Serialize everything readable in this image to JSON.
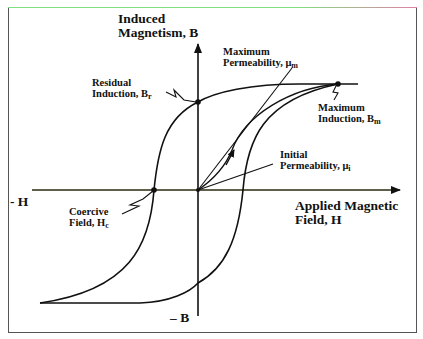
{
  "diagram": {
    "type": "hysteresis-loop",
    "y_axis": {
      "label_line1": "Induced",
      "label_line2": "Magnetism, B",
      "neg_label": "– B"
    },
    "x_axis": {
      "label_line1": "Applied Magnetic",
      "label_line2": "Field, H",
      "neg_label": "- H"
    },
    "annotations": {
      "residual": {
        "line1": "Residual",
        "line2": "Induction, B",
        "sub": "r"
      },
      "coercive": {
        "line1": "Coercive",
        "line2": "Field, H",
        "sub": "c"
      },
      "max_perm": {
        "line1": "Maximum",
        "line2": "Permeability, μ",
        "sub": "m"
      },
      "max_ind": {
        "line1": "Maximum",
        "line2": "Induction, B",
        "sub": "m"
      },
      "init_perm": {
        "line1": "Initial",
        "line2": "Permeability, μ",
        "sub": "i"
      }
    },
    "colors": {
      "line": "#111111",
      "axis": "#1a1a1a",
      "frame": "#555555"
    }
  }
}
